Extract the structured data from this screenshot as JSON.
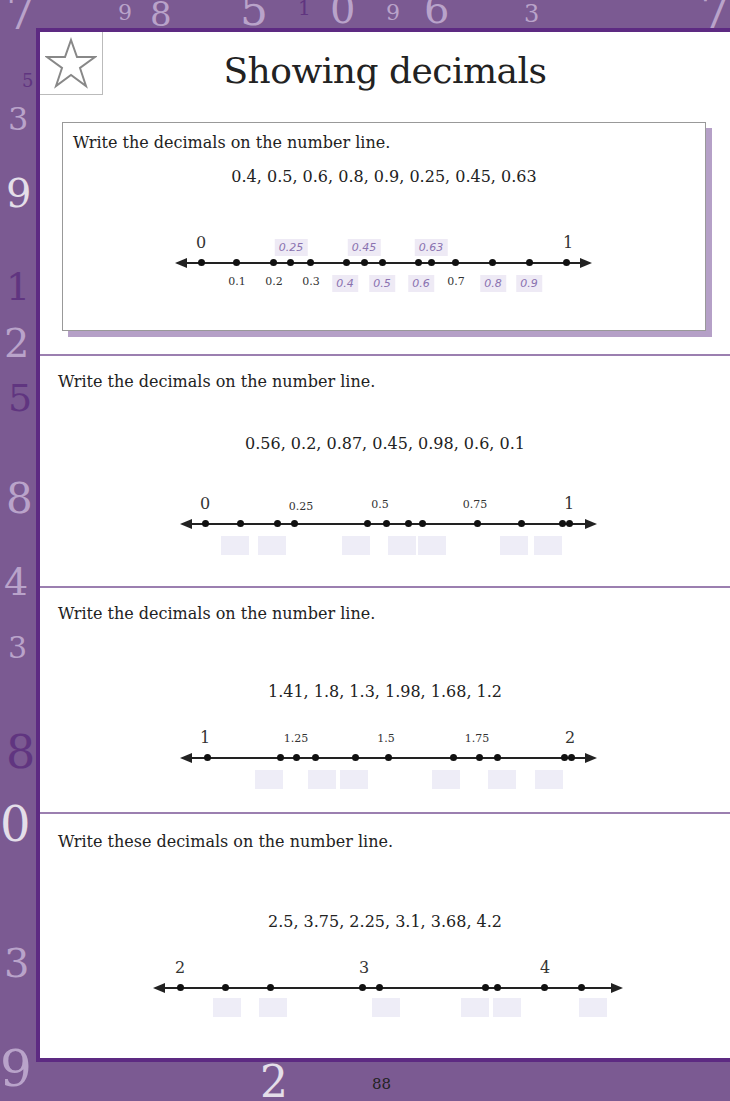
{
  "page": {
    "title": "Showing decimals",
    "page_number": "88",
    "accent_color": "#5d2a82",
    "background_color": "#7b5a92",
    "icon": "star-icon"
  },
  "exercises": [
    {
      "instruction": "Write the decimals on the number line.",
      "numbers": "0.4,  0.5,  0.6,  0.8,  0.9,  0.25,  0.45,  0.63",
      "start_label": "0",
      "end_label": "1",
      "tick_labels": [
        "0.1",
        "0.2",
        "0.3",
        "0.7"
      ],
      "answers_above": [
        "0.25",
        "0.45",
        "0.63"
      ],
      "answers_below": [
        "0.4",
        "0.5",
        "0.6",
        "0.8",
        "0.9"
      ]
    },
    {
      "instruction": "Write the decimals on the number line.",
      "numbers": "0.56,  0.2,  0.87,  0.45,  0.98,  0.6,  0.1",
      "start_label": "0",
      "end_label": "1",
      "tick_labels": [
        "0.25",
        "0.5",
        "0.75"
      ]
    },
    {
      "instruction": "Write the decimals on the number line.",
      "numbers": "1.41,  1.8,  1.3,  1.98,  1.68,  1.2",
      "start_label": "1",
      "end_label": "2",
      "tick_labels": [
        "1.25",
        "1.5",
        "1.75"
      ]
    },
    {
      "instruction": "Write these decimals on the number line.",
      "numbers": "2.5,  3.75,  2.25,  3.1,  3.68,  4.2",
      "start_label": "2",
      "mid_label": "3",
      "end_label": "4"
    }
  ]
}
